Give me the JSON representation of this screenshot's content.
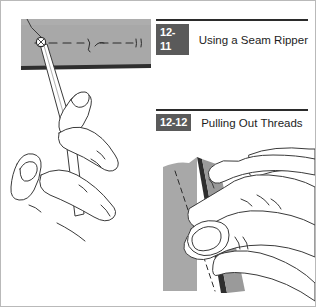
{
  "figure": {
    "panels": [
      {
        "id": "12-11",
        "number_label": "12-11",
        "title": "Using a Seam Ripper",
        "illustration_name": "hand-holding-seam-ripper-under-stitched-fabric"
      },
      {
        "id": "12-12",
        "number_label": "12-12",
        "title": "Pulling Out Threads",
        "illustration_name": "hand-pulling-loose-threads-from-opened-seam"
      }
    ]
  },
  "colors": {
    "fabric_gray": "#a8a8a8",
    "fabric_gray_dark": "#9a9a9a",
    "badge_background": "#5a5a5a",
    "badge_text": "#ffffff",
    "rule": "#2b2b2b",
    "line_art": "#3a3a3a",
    "page_background": "#ffffff",
    "page_border": "#b9b9b9"
  }
}
